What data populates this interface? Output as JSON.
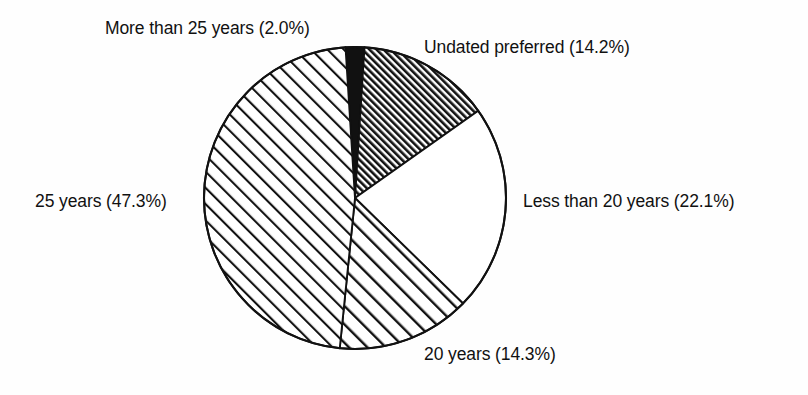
{
  "figure": {
    "background_color": "#fefefe",
    "outline_color": "#111111",
    "label_color": "#111111"
  },
  "chart_data": {
    "type": "pie",
    "title": "",
    "xlabel": "",
    "ylabel": "",
    "legend_position": "labels-around-pie",
    "grid": false,
    "start_angle_deg": 0,
    "direction": "clockwise",
    "center_px": [
      355,
      198
    ],
    "radius_px": 151,
    "categories": [
      "More than 25 years",
      "Undated preferred",
      "Less than 20 years",
      "20 years",
      "25 years"
    ],
    "values": [
      2.0,
      14.2,
      22.1,
      14.3,
      47.3
    ],
    "value_unit": "percent",
    "total": 99.9,
    "slices": [
      {
        "name": "more-than-25-years",
        "label": "More than 25 years (2.0%)",
        "category": "More than 25 years",
        "value": 2.0,
        "fill": "solid-black",
        "fill_color": "#111111",
        "start_deg": -3.6,
        "end_deg": 3.6
      },
      {
        "name": "undated-preferred",
        "label": "Undated preferred (14.2%)",
        "category": "Undated preferred",
        "value": 14.2,
        "fill": "dense-diagonal-hatch",
        "fill_color": "#ffffff",
        "start_deg": 3.6,
        "end_deg": 54.7
      },
      {
        "name": "less-than-20-years",
        "label": "Less than 20 years (22.1%)",
        "category": "Less than 20 years",
        "value": 22.1,
        "fill": "none",
        "fill_color": "#ffffff",
        "start_deg": 54.7,
        "end_deg": 134.3
      },
      {
        "name": "20-years",
        "label": "20 years (14.3%)",
        "category": "20 years",
        "value": 14.3,
        "fill": "medium-diagonal-hatch",
        "fill_color": "#ffffff",
        "start_deg": 134.3,
        "end_deg": 185.8
      },
      {
        "name": "25-years",
        "label": "25 years (47.3%)",
        "category": "25 years",
        "value": 47.3,
        "fill": "sparse-diagonal-hatch",
        "fill_color": "#ffffff",
        "start_deg": 185.8,
        "end_deg": 356.4
      }
    ]
  },
  "labels": {
    "more_than_25_years": "More than 25 years (2.0%)",
    "undated_preferred": "Undated preferred (14.2%)",
    "less_than_20_years": "Less than 20 years (22.1%)",
    "twenty_years": "20 years (14.3%)",
    "twentyfive_years": "25 years (47.3%)"
  }
}
